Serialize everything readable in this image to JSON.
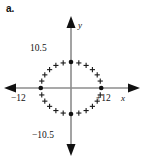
{
  "figure": {
    "part_label": "a.",
    "axes": {
      "x_axis_label": "x",
      "y_axis_label": "y",
      "axis_color": "#8c8c8c",
      "arrow_color": "#111111",
      "origin_px": {
        "x": 71,
        "y": 88
      }
    },
    "tick_labels": {
      "y_top": "10.5",
      "y_bottom": "−10.5",
      "x_left": "−12",
      "x_right": "+12"
    }
  },
  "chart_data": {
    "type": "scatter",
    "title": "",
    "xlabel": "x",
    "ylabel": "y",
    "grid": false,
    "legend": null,
    "xlim": [
      -16,
      16
    ],
    "ylim": [
      -14,
      14
    ],
    "xticks": [
      -12,
      12
    ],
    "yticks": [
      -10.5,
      10.5
    ],
    "xtick_labels": [
      "−12",
      "+12"
    ],
    "ytick_labels": [
      "−10.5",
      "10.5"
    ],
    "marker_style": "plus",
    "vertex_marker_style": "filled-circle",
    "vertex_points": [
      {
        "x": 0,
        "y": 10.5
      },
      {
        "x": 12,
        "y": 0
      },
      {
        "x": 0,
        "y": -10.5
      },
      {
        "x": -12,
        "y": 0
      }
    ],
    "points": [
      {
        "x": 3.1,
        "y": 10.1
      },
      {
        "x": 6.0,
        "y": 9.1
      },
      {
        "x": 8.5,
        "y": 7.4
      },
      {
        "x": 10.4,
        "y": 5.3
      },
      {
        "x": 11.6,
        "y": 2.8
      },
      {
        "x": 11.6,
        "y": -2.8
      },
      {
        "x": 10.4,
        "y": -5.3
      },
      {
        "x": 8.5,
        "y": -7.4
      },
      {
        "x": 6.0,
        "y": -9.1
      },
      {
        "x": 3.1,
        "y": -10.1
      },
      {
        "x": -3.1,
        "y": -10.1
      },
      {
        "x": -6.0,
        "y": -9.1
      },
      {
        "x": -8.5,
        "y": -7.4
      },
      {
        "x": -10.4,
        "y": -5.3
      },
      {
        "x": -11.6,
        "y": -2.8
      },
      {
        "x": -11.6,
        "y": 2.8
      },
      {
        "x": -10.4,
        "y": 5.3
      },
      {
        "x": -8.5,
        "y": 7.4
      },
      {
        "x": -6.0,
        "y": 9.1
      },
      {
        "x": -3.1,
        "y": 10.1
      }
    ]
  }
}
